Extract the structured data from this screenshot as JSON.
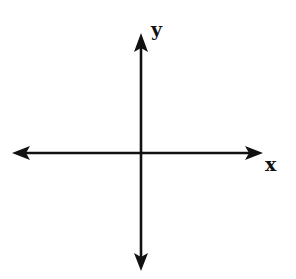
{
  "diagram": {
    "type": "coordinate-axes",
    "x_axis": {
      "label": "x",
      "y_position": 153,
      "start_x": 12,
      "end_x": 263,
      "arrow_both_ends": true
    },
    "y_axis": {
      "label": "y",
      "x_position": 141,
      "start_y": 33,
      "end_y": 271,
      "arrow_both_ends": true
    },
    "colors": {
      "line": "#111111",
      "background": "#ffffff"
    }
  }
}
